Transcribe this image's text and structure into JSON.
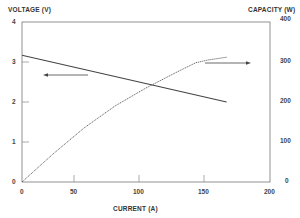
{
  "chart_data": {
    "type": "line",
    "title": "",
    "xlabel": "CURRENT (A)",
    "ylabel": "VOLTAGE (V)",
    "y2label": "CAPACITY (W)",
    "xlim": [
      0,
      200
    ],
    "ylim": [
      0,
      4
    ],
    "y2lim": [
      0,
      400
    ],
    "x_ticks": [
      "0",
      "50",
      "100",
      "150",
      "200"
    ],
    "y_ticks": [
      "0",
      "1",
      "2",
      "3",
      "4"
    ],
    "y2_ticks": [
      "0",
      "100",
      "200",
      "300",
      "400"
    ],
    "grid": false,
    "legend": null,
    "annotations": [
      {
        "type": "arrow",
        "direction": "left",
        "meaning": "voltage curve uses left axis"
      },
      {
        "type": "arrow",
        "direction": "right",
        "meaning": "capacity curve uses right axis"
      }
    ],
    "series": [
      {
        "name": "Voltage",
        "axis": "left",
        "style": "solid",
        "x": [
          0,
          165
        ],
        "values": [
          3.17,
          2.0
        ]
      },
      {
        "name": "Capacity",
        "axis": "right",
        "style": "dotted",
        "x": [
          0,
          25,
          50,
          75,
          100,
          125,
          140,
          150,
          165
        ],
        "values": [
          0,
          70,
          135,
          190,
          235,
          275,
          298,
          305,
          312
        ]
      }
    ]
  },
  "labels": {
    "y_left": "VOLTAGE (V)",
    "y_right": "CAPACITY (W)",
    "x": "CURRENT (A)"
  },
  "ticks": {
    "x": [
      "0",
      "50",
      "100",
      "150",
      "200"
    ],
    "y_left": [
      "4",
      "3",
      "2",
      "1",
      "0"
    ],
    "y_right": [
      "400",
      "300",
      "200",
      "100",
      "0"
    ]
  }
}
